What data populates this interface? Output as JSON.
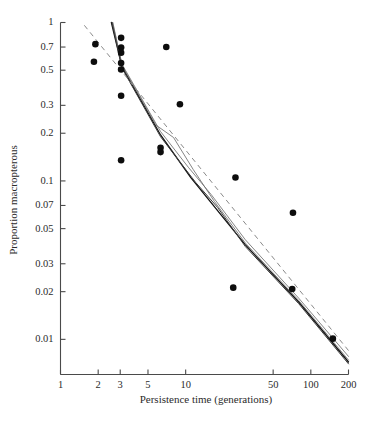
{
  "chart_data": {
    "type": "scatter",
    "title": "",
    "xlabel": "Persistence time (generations)",
    "ylabel": "Proportion macropterous",
    "xscale": "log",
    "yscale": "log",
    "xlim": [
      1,
      200
    ],
    "ylim": [
      0.006,
      1
    ],
    "grid": false,
    "legend": "none",
    "xticks": [
      1,
      2,
      3,
      5,
      10,
      50,
      100,
      200
    ],
    "xtick_labels": [
      "1",
      "2",
      "3",
      "5",
      "10",
      "50",
      "100",
      "200"
    ],
    "yticks": [
      1,
      0.7,
      0.5,
      0.3,
      0.2,
      0.1,
      0.07,
      0.05,
      0.03,
      0.02,
      0.01
    ],
    "ytick_labels": [
      "1",
      "0.7",
      "0.5",
      "0.3",
      "0.2",
      "0.1",
      "0.07",
      "0.05",
      "0.03",
      "0.02",
      "0.01"
    ],
    "series": [
      {
        "name": "observed populations",
        "type": "scatter",
        "marker": "filled-circle",
        "color": "#0d0d0d",
        "points": [
          {
            "x": 1.9,
            "y": 0.73
          },
          {
            "x": 1.85,
            "y": 0.565
          },
          {
            "x": 3.05,
            "y": 0.8
          },
          {
            "x": 3.05,
            "y": 0.695
          },
          {
            "x": 3.05,
            "y": 0.645
          },
          {
            "x": 3.05,
            "y": 0.555
          },
          {
            "x": 3.05,
            "y": 0.505
          },
          {
            "x": 3.05,
            "y": 0.345
          },
          {
            "x": 3.05,
            "y": 0.135
          },
          {
            "x": 7.0,
            "y": 0.7
          },
          {
            "x": 6.3,
            "y": 0.162
          },
          {
            "x": 6.3,
            "y": 0.152
          },
          {
            "x": 9.0,
            "y": 0.305
          },
          {
            "x": 25.0,
            "y": 0.105
          },
          {
            "x": 24.0,
            "y": 0.0212
          },
          {
            "x": 72.0,
            "y": 0.063
          },
          {
            "x": 71.0,
            "y": 0.0208
          },
          {
            "x": 150.0,
            "y": 0.0101
          }
        ]
      },
      {
        "name": "fitted regression",
        "type": "line",
        "style": "solid-thick",
        "color": "#111111",
        "points": [
          {
            "x": 2.55,
            "y": 1.0
          },
          {
            "x": 3.1,
            "y": 0.525
          },
          {
            "x": 6.3,
            "y": 0.195
          },
          {
            "x": 11.0,
            "y": 0.105
          },
          {
            "x": 30.0,
            "y": 0.0395
          },
          {
            "x": 80.0,
            "y": 0.0172
          },
          {
            "x": 200.0,
            "y": 0.0072
          }
        ]
      },
      {
        "name": "simulation run 1",
        "type": "line",
        "style": "solid-thin",
        "color": "#6f6f6f",
        "points": [
          {
            "x": 2.6,
            "y": 1.0
          },
          {
            "x": 3.1,
            "y": 0.545
          },
          {
            "x": 6.3,
            "y": 0.205
          },
          {
            "x": 10.5,
            "y": 0.122
          },
          {
            "x": 16.0,
            "y": 0.082
          },
          {
            "x": 30.0,
            "y": 0.0425
          },
          {
            "x": 80.0,
            "y": 0.0182
          },
          {
            "x": 200.0,
            "y": 0.0078
          }
        ]
      },
      {
        "name": "simulation run 2",
        "type": "line",
        "style": "solid-thin",
        "color": "#6f6f6f",
        "points": [
          {
            "x": 2.62,
            "y": 1.0
          },
          {
            "x": 3.1,
            "y": 0.535
          },
          {
            "x": 5.8,
            "y": 0.225
          },
          {
            "x": 8.0,
            "y": 0.188
          },
          {
            "x": 11.5,
            "y": 0.118
          },
          {
            "x": 17.0,
            "y": 0.074
          },
          {
            "x": 30.0,
            "y": 0.0405
          },
          {
            "x": 80.0,
            "y": 0.0176
          },
          {
            "x": 200.0,
            "y": 0.0074
          }
        ]
      },
      {
        "name": "simulation run 3",
        "type": "line",
        "style": "solid-thin",
        "color": "#3c3c3c",
        "points": [
          {
            "x": 2.58,
            "y": 1.0
          },
          {
            "x": 3.1,
            "y": 0.515
          },
          {
            "x": 6.3,
            "y": 0.19
          },
          {
            "x": 12.0,
            "y": 0.098
          },
          {
            "x": 18.0,
            "y": 0.068
          },
          {
            "x": 30.0,
            "y": 0.0385
          },
          {
            "x": 80.0,
            "y": 0.0168
          },
          {
            "x": 200.0,
            "y": 0.007
          }
        ]
      },
      {
        "name": "reference dashed line",
        "type": "line",
        "style": "dashed",
        "color": "#8a8a8a",
        "points": [
          {
            "x": 1.55,
            "y": 0.96
          },
          {
            "x": 200.0,
            "y": 0.0085
          }
        ]
      }
    ]
  }
}
